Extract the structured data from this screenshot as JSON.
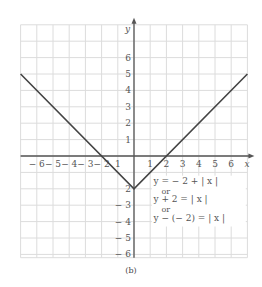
{
  "chart_data": {
    "type": "line",
    "title": "",
    "caption": "(b)",
    "xlabel": "x",
    "ylabel": "y",
    "xlim": [
      -7,
      7
    ],
    "ylim": [
      -6.2,
      8
    ],
    "grid": true,
    "x_ticks": [
      -6,
      -5,
      -4,
      -3,
      -2,
      -1,
      1,
      2,
      3,
      4,
      5,
      6
    ],
    "x_tick_labels": [
      "− 6",
      "− 5",
      "− 4",
      "− 3",
      "− 2",
      "1",
      "1",
      "2",
      "3",
      "4",
      "5",
      "6"
    ],
    "y_ticks": [
      6,
      5,
      4,
      3,
      2,
      1,
      -2,
      -3,
      -4,
      -5,
      -6
    ],
    "y_tick_labels": [
      "6",
      "5",
      "4",
      "3",
      "2",
      "1",
      "2",
      "− 3",
      "− 4",
      "− 5",
      "− 6"
    ],
    "series": [
      {
        "name": "y = -2 + |x|",
        "x": [
          -7,
          0,
          7
        ],
        "y": [
          5,
          -2,
          5
        ],
        "color": "#444444"
      }
    ],
    "annotations": [
      "y = − 2 + | x |",
      "or",
      "y + 2 = | x |",
      "or",
      "y − (− 2) = | x |"
    ],
    "vertex": [
      0,
      -2
    ],
    "x_intercepts": [
      -2,
      2
    ]
  }
}
